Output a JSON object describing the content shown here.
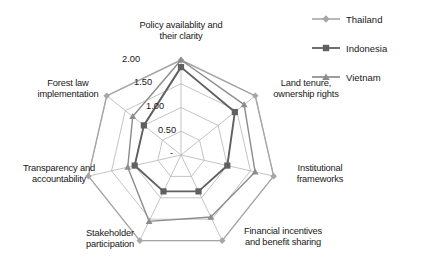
{
  "chart_data": {
    "type": "radar",
    "title": "",
    "xlabel": "",
    "ylabel": "",
    "categories": [
      "Policy availablity and\ntheir clarity",
      "Land tenure,\nownership rights",
      "Institutional\nframeworks",
      "Financial incentives\nand benefit sharing",
      "Stakeholder\nparticipation",
      "Transparency and\naccountability",
      "Forest law\nimplementation"
    ],
    "tick_labels": [
      "-",
      "0.50",
      "1.00",
      "1.50",
      "2.00"
    ],
    "tick_values": [
      0,
      0.5,
      1.0,
      1.5,
      2.0
    ],
    "rlim": [
      0,
      2.0
    ],
    "grid": true,
    "legend_position": "top-right",
    "series": [
      {
        "name": "Thailand",
        "color": "#a6a6a6",
        "marker": "diamond",
        "values": [
          2.0,
          2.0,
          2.0,
          2.0,
          2.0,
          2.0,
          2.0
        ]
      },
      {
        "name": "Indonesia",
        "color": "#606060",
        "marker": "square",
        "values": [
          1.85,
          1.45,
          1.0,
          0.85,
          0.85,
          1.0,
          1.0
        ]
      },
      {
        "name": "Vietnam",
        "color": "#8c8c8c",
        "marker": "triangle",
        "values": [
          2.0,
          1.7,
          1.6,
          1.45,
          1.55,
          1.15,
          1.3
        ]
      }
    ]
  },
  "legend": {
    "entries": [
      {
        "label": "Thailand"
      },
      {
        "label": "Indonesia"
      },
      {
        "label": "Vietnam"
      }
    ]
  },
  "axis_labels": {
    "policy": "Policy availablity and\ntheir clarity",
    "land_tenure": "Land tenure,\nownership rights",
    "institutional": "Institutional\nframeworks",
    "financial": "Financial incentives\nand benefit sharing",
    "stakeholder": "Stakeholder\nparticipation",
    "transparency": "Transparency and\naccountability",
    "forest_law": "Forest law\nimplementation"
  },
  "ticks": {
    "t0": "-",
    "t1": "0.50",
    "t2": "1.00",
    "t3": "1.50",
    "t4": "2.00"
  },
  "colors": {
    "thailand": "#a6a6a6",
    "indonesia": "#606060",
    "vietnam": "#8c8c8c",
    "grid": "#b5b5b5",
    "text": "#181818"
  }
}
